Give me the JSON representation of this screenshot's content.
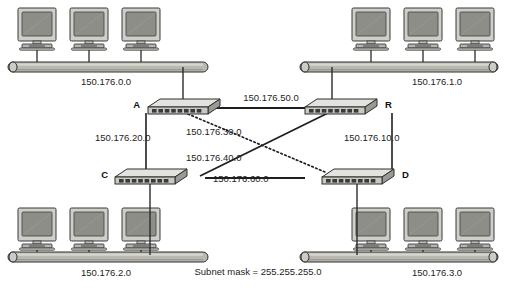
{
  "diagram": {
    "caption": "Subnet mask = 255.255.255.0",
    "colors": {
      "ink": "#1d1d1d",
      "line": "#2b2b2b",
      "bus_body": "#b9b9b2",
      "bus_top": "#d9d9d2",
      "bus_shadow": "#8d8d86",
      "router_top": "#e2e2de",
      "router_face": "#c9c9c4",
      "router_side": "#9a9a94",
      "port": "#3a3a38",
      "monitor_bezel": "#cfcfca",
      "monitor_screen": "#8e8e88",
      "monitor_base": "#b5b5af"
    }
  },
  "segments": [
    {
      "id": "lan-top-left",
      "label": "150.176.0.0",
      "hosts": 3
    },
    {
      "id": "lan-top-right",
      "label": "150.176.1.0",
      "hosts": 3
    },
    {
      "id": "lan-bottom-left",
      "label": "150.176.2.0",
      "hosts": 3
    },
    {
      "id": "lan-bottom-right",
      "label": "150.176.3.0",
      "hosts": 3
    }
  ],
  "routers": [
    {
      "id": "router-a",
      "label": "A"
    },
    {
      "id": "router-r",
      "label": "R"
    },
    {
      "id": "router-c",
      "label": "C"
    },
    {
      "id": "router-d",
      "label": "D"
    }
  ],
  "links": [
    {
      "id": "link-a-r",
      "label": "150.176.50.0",
      "from": "A",
      "to": "R",
      "style": "solid",
      "orientation": "horizontal"
    },
    {
      "id": "link-a-c",
      "label": "150.176.20.0",
      "from": "A",
      "to": "C",
      "style": "solid",
      "orientation": "vertical"
    },
    {
      "id": "link-r-d",
      "label": "150.176.10.0",
      "from": "R",
      "to": "D",
      "style": "solid",
      "orientation": "vertical"
    },
    {
      "id": "link-c-d",
      "label": "150.176.60.0",
      "from": "C",
      "to": "D",
      "style": "solid",
      "orientation": "horizontal"
    },
    {
      "id": "link-a-d",
      "label": "150.176.30.0",
      "from": "A",
      "to": "D",
      "style": "dotted",
      "orientation": "diagonal"
    },
    {
      "id": "link-c-r",
      "label": "150.176.40.0",
      "from": "C",
      "to": "R",
      "style": "solid",
      "orientation": "diagonal"
    }
  ]
}
